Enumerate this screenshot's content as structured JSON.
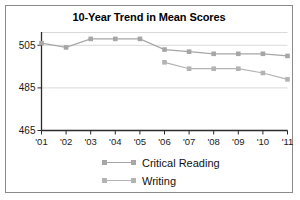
{
  "chart_data": {
    "type": "line",
    "title": "10-Year Trend in Mean Scores",
    "xlabel": "",
    "ylabel": "",
    "categories": [
      "'01",
      "'02",
      "'03",
      "'04",
      "'05",
      "'06",
      "'07",
      "'08",
      "'09",
      "'10",
      "'11"
    ],
    "ylim": [
      465,
      511
    ],
    "yticks": [
      465,
      485,
      505
    ],
    "ytick_labels": [
      "465",
      "485",
      "505"
    ],
    "grid": true,
    "grid_axis": "y",
    "legend_position": "bottom-center",
    "series": [
      {
        "name": "Critical Reading",
        "color": "#a6a6a6",
        "marker": "square",
        "values": [
          506,
          504,
          508,
          508,
          508,
          503,
          502,
          501,
          501,
          501,
          500
        ]
      },
      {
        "name": "Writing",
        "color": "#b3b3b3",
        "marker": "square",
        "values": [
          null,
          null,
          null,
          null,
          null,
          497,
          494,
          494,
          494,
          492,
          489
        ]
      }
    ]
  },
  "colors": {
    "frame_border": "#8a8a8a",
    "axis": "#2b2b2b",
    "gridline": "#d9d9d9",
    "text": "#111111",
    "background": "#ffffff"
  }
}
